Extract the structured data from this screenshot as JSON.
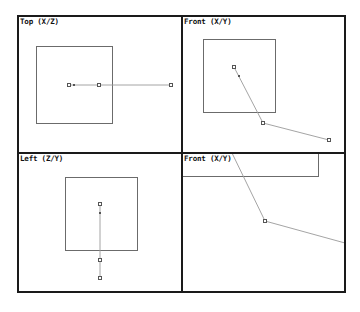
{
  "viewports": [
    {
      "id": "top",
      "label": "Top (X/Z)",
      "frame": {
        "x": 18,
        "y": 16,
        "w": 164,
        "h": 137
      },
      "box": {
        "x": 36,
        "y": 46,
        "w": 76,
        "h": 77
      },
      "polyline": [
        [
          69,
          85
        ],
        [
          99,
          85
        ],
        [
          171,
          85
        ]
      ],
      "vertices": [
        [
          69,
          85
        ],
        [
          99,
          85
        ],
        [
          171,
          85
        ]
      ],
      "minor_points": [
        [
          74,
          85
        ]
      ]
    },
    {
      "id": "front",
      "label": "Front (X/Y)",
      "frame": {
        "x": 182,
        "y": 16,
        "w": 163,
        "h": 137
      },
      "box": {
        "x": 203,
        "y": 39,
        "w": 72,
        "h": 73
      },
      "polyline": [
        [
          234,
          67
        ],
        [
          263,
          123
        ],
        [
          329,
          140
        ]
      ],
      "vertices": [
        [
          234,
          67
        ],
        [
          263,
          123
        ],
        [
          329,
          140
        ]
      ],
      "minor_points": [
        [
          239,
          76
        ]
      ]
    },
    {
      "id": "left",
      "label": "Left (Z/Y)",
      "frame": {
        "x": 18,
        "y": 153,
        "w": 164,
        "h": 139
      },
      "box": {
        "x": 65,
        "y": 177,
        "w": 72,
        "h": 73
      },
      "polyline": [
        [
          100,
          204
        ],
        [
          100,
          278
        ]
      ],
      "vertices": [
        [
          100,
          204
        ],
        [
          100,
          260
        ],
        [
          100,
          278
        ]
      ],
      "minor_points": [
        [
          100,
          213
        ]
      ]
    },
    {
      "id": "perspective",
      "label": "Front (X/Y)",
      "frame": {
        "x": 182,
        "y": 153,
        "w": 163,
        "h": 139
      },
      "box": {
        "x": 150,
        "y": 100,
        "w": 168,
        "h": 76
      },
      "polyline": [
        [
          232,
          153
        ],
        [
          265,
          221
        ],
        [
          345,
          243
        ]
      ],
      "vertices": [
        [
          265,
          221
        ]
      ],
      "minor_points": []
    }
  ],
  "colors": {
    "frame": "#1a1a1a",
    "box": "#6b6b6b",
    "line": "#9a9a9a",
    "vertex": "#555555",
    "background": "#ffffff"
  }
}
